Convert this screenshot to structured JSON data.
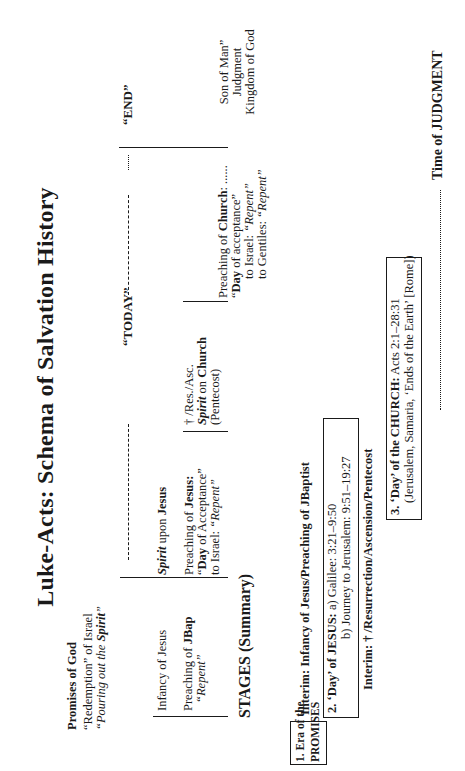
{
  "title": "Luke-Acts: Schema of Salvation History",
  "promises": {
    "heading": "Promises of God",
    "line1_quote": "“Redemption”",
    "line1_rest": " of Israel",
    "line2_prefix": "“Pouring out the ",
    "line2_spirit": "Spirit",
    "line2_suffix": "”"
  },
  "timeline": {
    "today_label": "“TODAY”",
    "end_label": "“END”",
    "trailing_dots": "......"
  },
  "infancy": {
    "label": "Infancy of Jesus",
    "jbap_prefix": "Preaching of ",
    "jbap_bold": "JBap",
    "jbap_repent": "“Repent”"
  },
  "jesus": {
    "spirit_italic": "Spirit",
    "spirit_rest": " upon ",
    "spirit_bold": "Jesus",
    "preach_prefix": "Preaching of ",
    "preach_bold": "Jesus:",
    "day_open": "“",
    "day_bold": "Day",
    "day_rest": " of Acceptance”",
    "israel_prefix": "to Israel: ",
    "israel_repent": "“Repent”"
  },
  "resurrection": {
    "line1": "† /Res./Asc.",
    "spirit_italic": "Spirit",
    "spirit_mid": " on ",
    "spirit_bold": "Church",
    "line3": "(Pentecost)"
  },
  "church": {
    "preach_prefix": "Preaching of ",
    "preach_bold": "Church",
    "preach_suffix": ": ......",
    "day_open": "“",
    "day_bold": "Day",
    "day_rest": " of acceptance”",
    "israel_prefix": "to Israel: ",
    "israel_repent": "“Repent”",
    "gentiles_prefix": "to Gentiles: ",
    "gentiles_repent": "“Repent”"
  },
  "end": {
    "line1": "Son of Man”",
    "line2": "Judgment",
    "line3": "Kingdom of God"
  },
  "stages": {
    "heading": "STAGES (Summary)",
    "stage1": {
      "line1": "1. Era of the",
      "line2": "PROMISES"
    },
    "interim1": "Interim: Infancy of Jesus/Preaching of JBaptist",
    "stage2": {
      "bold": "2. ‘Day’ of JESUS:",
      "line1_rest": " a) Galilee: 3:21–9:50",
      "line2": "b) Journey to Jerusalem: 9:51–19:27"
    },
    "interim2": "Interim: † /Resurrection/Ascension/Pentecost",
    "stage3": {
      "bold": "3. ‘Day’ of the CHURCH:",
      "line1_rest": " Acts 2:1–28:31",
      "line2": "(Jerusalem, Samaria, ‘Ends of the Earth’ [Rome])"
    },
    "judgment": "Time of JUDGMENT"
  }
}
